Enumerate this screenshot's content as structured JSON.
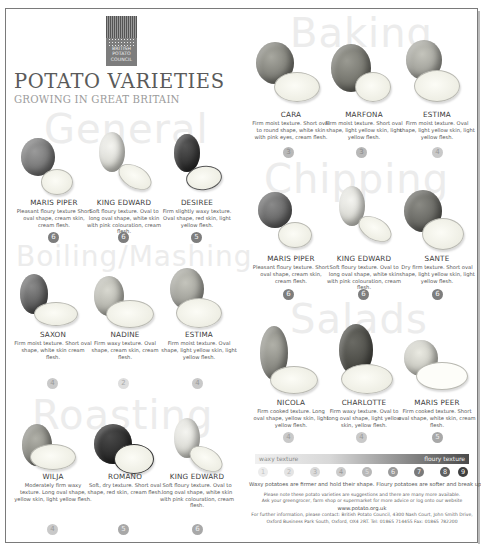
{
  "logo": {
    "lines": [
      "BRITISH",
      "POTATO",
      "COUNCIL"
    ]
  },
  "header": {
    "title": "POTATO VARIETIES",
    "subtitle": "GROWING IN GREAT BRITAIN"
  },
  "sections": {
    "general": "General",
    "boiling": "Boiling/Mashing",
    "roasting": "Roasting",
    "baking": "Baking",
    "chipping": "Chipping",
    "salads": "Salads"
  },
  "varieties": {
    "general": [
      {
        "name": "MARIS PIPER",
        "description": "Pleasant floury texture Short oval shape, cream skin, cream flesh.",
        "rating": "6"
      },
      {
        "name": "KING EDWARD",
        "description": "Soft floury texture. Oval to long oval shape, white skin with pink colouration, cream flesh.",
        "rating": "6"
      },
      {
        "name": "DESIREE",
        "description": "Firm slightly waxy texture. Oval shape, red skin, light yellow flesh.",
        "rating": "5"
      }
    ],
    "boiling": [
      {
        "name": "SAXON",
        "description": "Firm moist texture. Short oval shape, white skin cream flesh.",
        "rating": "4"
      },
      {
        "name": "NADINE",
        "description": "Firm waxy texture. Oval shape, cream skin, cream flesh.",
        "rating": "2"
      },
      {
        "name": "ESTIMA",
        "description": "Firm moist texture. Oval shape, light yellow skin, light yellow flesh.",
        "rating": "4"
      }
    ],
    "roasting": [
      {
        "name": "WILJA",
        "description": "Moderately firm waxy texture. Long oval shape, yellow skin, light yellow flesh.",
        "rating": "4"
      },
      {
        "name": "ROMANO",
        "description": "Soft, dry texture. Short oval shape, red skin, cream flesh.",
        "rating": "5"
      },
      {
        "name": "KING EDWARD",
        "description": "Soft floury texture. Oval to long oval shape, white skin with pink colouration, cream flesh.",
        "rating": "6"
      }
    ],
    "baking": [
      {
        "name": "CARA",
        "description": "Firm moist texture. Short oval to round shape, white skin with pink eyes, cream flesh.",
        "rating": "3"
      },
      {
        "name": "MARFONA",
        "description": "Firm moist texture. Short oval shape, light yellow skin, light yellow flesh.",
        "rating": "3"
      },
      {
        "name": "ESTIMA",
        "description": "Firm moist texture. Oval shape, light yellow skin, light yellow flesh.",
        "rating": "4"
      }
    ],
    "chipping": [
      {
        "name": "MARIS PIPER",
        "description": "Pleasant floury texture. Short oval shape, cream skin, cream flesh.",
        "rating": "6"
      },
      {
        "name": "KING EDWARD",
        "description": "Soft floury texture. Oval to long oval shape, white skin with pink colouration, cream flesh.",
        "rating": "6"
      },
      {
        "name": "SANTE",
        "description": "Dry firm texture. Short oval shape, light yellow skin, light yellow flesh.",
        "rating": "6"
      }
    ],
    "salads": [
      {
        "name": "NICOLA",
        "description": "Firm cooked texture. Long oval shape, yellow skin, light yellow flesh.",
        "rating": "4"
      },
      {
        "name": "CHARLOTTE",
        "description": "Firm waxy texture. Oval to long oval shape, light yellow skin, yellow flesh.",
        "rating": "4"
      },
      {
        "name": "MARIS PEER",
        "description": "Firm cooked texture. Short oval shape, white skin, cream flesh.",
        "rating": "5"
      }
    ]
  },
  "scale": {
    "left_label": "waxy texture",
    "right_label": "floury texture",
    "steps": [
      "1",
      "2",
      "3",
      "4",
      "5",
      "6",
      "7",
      "8",
      "9"
    ],
    "note": "Waxy potatoes are firmer and hold their shape. Floury potatoes are softer and break up more easily."
  },
  "footer": {
    "line1": "Please note these potato varieties are suggestions and there are many more available.",
    "line2": "Ask your greengrocer, farm shop or supermarket for more advice or log onto our website",
    "url": "www.potato.org.uk",
    "line3": "For further information, please contact: British Potato Council, 4300 Nash Court, John Smith Drive,",
    "line4": "Oxford Business Park South, Oxford, OX4 2RT.   Tel: 01865 714455   Fax: 01865 782200"
  }
}
